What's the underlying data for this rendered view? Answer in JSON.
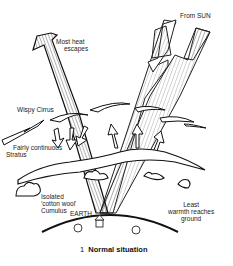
{
  "diagram": {
    "title_number": "1",
    "title": "Normal situation",
    "labels": {
      "most_heat": [
        "Most heat",
        "escapes"
      ],
      "from_sun": "From SUN",
      "wispy_cirrus": "Wispy Cirrus",
      "stratus": [
        "Fairly continuous",
        "Stratus"
      ],
      "cumulus": [
        "Isolated",
        "'cotton wool'",
        "Cumulus"
      ],
      "earth": "EARTH",
      "least_warmth": [
        "Least",
        "warmth reaches",
        "ground"
      ]
    },
    "elements": {
      "outgoing_beam": "Outgoing heat arrow from Earth to space",
      "incoming_beam": "Incoming sunlight beam from Sun to Earth",
      "small_arrows_down": 3,
      "small_arrows_up": 3
    }
  }
}
